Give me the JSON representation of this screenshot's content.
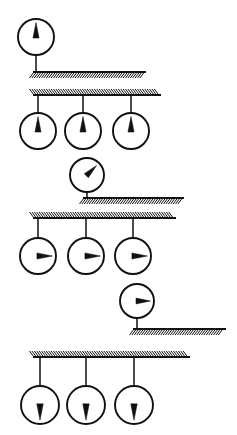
{
  "figure": {
    "stroke_color": "#111111",
    "background_color": "#ffffff",
    "canvas": {
      "width": 237,
      "height": 435
    }
  },
  "groups": [
    {
      "id": "group-1",
      "label": "Single dial above bar, needle up",
      "bar": {
        "x1": 33,
        "x2": 146,
        "y": 72,
        "hatch_side": "below",
        "hatch_height": 6
      },
      "dials": [
        {
          "id": "dial-1-1",
          "cx": 36,
          "cy": 37,
          "r": 18,
          "needle_direction": "up",
          "needle_angle_deg": 0,
          "stem_from": "bottom",
          "stem_x": 36,
          "stem_y1": 55,
          "stem_y2": 72
        }
      ]
    },
    {
      "id": "group-2",
      "label": "Three dials below bar, needles up",
      "bar": {
        "x1": 33,
        "x2": 161,
        "y": 95,
        "hatch_side": "above",
        "hatch_height": 6
      },
      "dials": [
        {
          "id": "dial-2-1",
          "cx": 38,
          "cy": 131,
          "r": 18,
          "needle_direction": "up",
          "needle_angle_deg": 0,
          "stem_from": "top",
          "stem_x": 38,
          "stem_y1": 95,
          "stem_y2": 113
        },
        {
          "id": "dial-2-2",
          "cx": 83,
          "cy": 131,
          "r": 18,
          "needle_direction": "up",
          "needle_angle_deg": 0,
          "stem_from": "top",
          "stem_x": 83,
          "stem_y1": 95,
          "stem_y2": 113
        },
        {
          "id": "dial-2-3",
          "cx": 131,
          "cy": 131,
          "r": 18,
          "needle_direction": "up",
          "needle_angle_deg": 0,
          "stem_from": "top",
          "stem_x": 131,
          "stem_y1": 95,
          "stem_y2": 113
        }
      ]
    },
    {
      "id": "group-3",
      "label": "Single dial above bar, needle up-right",
      "bar": {
        "x1": 83,
        "x2": 184,
        "y": 198,
        "hatch_side": "below",
        "hatch_height": 6
      },
      "dials": [
        {
          "id": "dial-3-1",
          "cx": 87,
          "cy": 175,
          "r": 17,
          "needle_direction": "up-right",
          "needle_angle_deg": 45,
          "stem_from": "bottom",
          "stem_x": 87,
          "stem_y1": 192,
          "stem_y2": 198
        }
      ]
    },
    {
      "id": "group-4",
      "label": "Three dials below bar, needles right",
      "bar": {
        "x1": 33,
        "x2": 176,
        "y": 218,
        "hatch_side": "above",
        "hatch_height": 6
      },
      "dials": [
        {
          "id": "dial-4-1",
          "cx": 38,
          "cy": 256,
          "r": 18,
          "needle_direction": "right",
          "needle_angle_deg": 90,
          "stem_from": "top",
          "stem_x": 38,
          "stem_y1": 218,
          "stem_y2": 238
        },
        {
          "id": "dial-4-2",
          "cx": 86,
          "cy": 256,
          "r": 18,
          "needle_direction": "right",
          "needle_angle_deg": 90,
          "stem_from": "top",
          "stem_x": 86,
          "stem_y1": 218,
          "stem_y2": 238
        },
        {
          "id": "dial-4-3",
          "cx": 133,
          "cy": 256,
          "r": 18,
          "needle_direction": "right",
          "needle_angle_deg": 90,
          "stem_from": "top",
          "stem_x": 133,
          "stem_y1": 218,
          "stem_y2": 238
        }
      ]
    },
    {
      "id": "group-5",
      "label": "Single dial above bar, needle right",
      "bar": {
        "x1": 133,
        "x2": 226,
        "y": 329,
        "hatch_side": "below",
        "hatch_height": 6
      },
      "dials": [
        {
          "id": "dial-5-1",
          "cx": 137,
          "cy": 301,
          "r": 17,
          "needle_direction": "right",
          "needle_angle_deg": 90,
          "stem_from": "bottom",
          "stem_x": 137,
          "stem_y1": 318,
          "stem_y2": 329
        }
      ]
    },
    {
      "id": "group-6",
      "label": "Three dials below bar, needles down",
      "bar": {
        "x1": 33,
        "x2": 190,
        "y": 357,
        "hatch_side": "above",
        "hatch_height": 6
      },
      "dials": [
        {
          "id": "dial-6-1",
          "cx": 40,
          "cy": 405,
          "r": 19,
          "needle_direction": "down",
          "needle_angle_deg": 180,
          "stem_from": "top",
          "stem_x": 40,
          "stem_y1": 357,
          "stem_y2": 386
        },
        {
          "id": "dial-6-2",
          "cx": 86,
          "cy": 405,
          "r": 19,
          "needle_direction": "down",
          "needle_angle_deg": 180,
          "stem_from": "top",
          "stem_x": 86,
          "stem_y1": 357,
          "stem_y2": 386
        },
        {
          "id": "dial-6-3",
          "cx": 134,
          "cy": 405,
          "r": 19,
          "needle_direction": "down",
          "needle_angle_deg": 180,
          "stem_from": "top",
          "stem_x": 134,
          "stem_y1": 357,
          "stem_y2": 386
        }
      ]
    }
  ]
}
